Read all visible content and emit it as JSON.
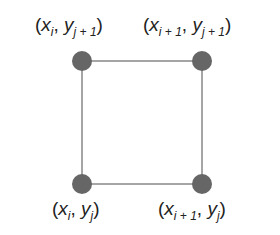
{
  "diagram": {
    "type": "grid-cell",
    "nodes": [
      {
        "id": "top-left",
        "x": 82,
        "y": 61,
        "label_var": "x",
        "label_sub": "i",
        "label_var2": "y",
        "label_sub2": "j + 1"
      },
      {
        "id": "top-right",
        "x": 202,
        "y": 61,
        "label_var": "x",
        "label_sub": "i + 1",
        "label_var2": "y",
        "label_sub2": "j + 1"
      },
      {
        "id": "bottom-left",
        "x": 82,
        "y": 184,
        "label_var": "x",
        "label_sub": "i",
        "label_var2": "y",
        "label_sub2": "j"
      },
      {
        "id": "bottom-right",
        "x": 202,
        "y": 184,
        "label_var": "x",
        "label_sub": "i + 1",
        "label_var2": "y",
        "label_sub2": "j"
      }
    ],
    "colors": {
      "node": "#666666",
      "edge": "#888888",
      "text": "#222222"
    }
  }
}
